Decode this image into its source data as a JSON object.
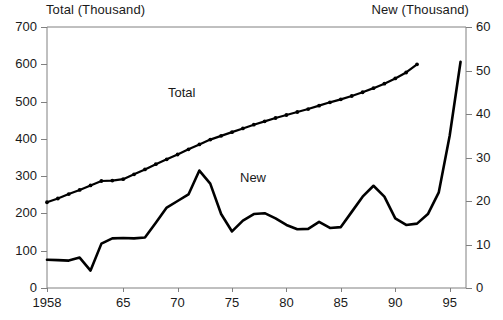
{
  "chart_data": {
    "type": "line",
    "title": "",
    "xlabel": "",
    "left_axis_title": "Total (Thousand)",
    "right_axis_title": "New (Thousand)",
    "grid": false,
    "legend_position": "inline-annotations",
    "x": [
      1958,
      1959,
      1960,
      1961,
      1962,
      1963,
      1964,
      1965,
      1966,
      1967,
      1968,
      1969,
      1970,
      1971,
      1972,
      1973,
      1974,
      1975,
      1976,
      1977,
      1978,
      1979,
      1980,
      1981,
      1982,
      1983,
      1984,
      1985,
      1986,
      1987,
      1988,
      1989,
      1990,
      1991,
      1992,
      1993,
      1994,
      1995,
      1996
    ],
    "xlim": [
      1958,
      1996.5
    ],
    "xticks": [
      1958,
      1965,
      1970,
      1975,
      1980,
      1985,
      1990,
      1995
    ],
    "xticklabels": [
      "1958",
      "65",
      "70",
      "75",
      "80",
      "85",
      "90",
      "95"
    ],
    "ylim_left": [
      0,
      700
    ],
    "yticks_left": [
      0,
      100,
      200,
      300,
      400,
      500,
      600,
      700
    ],
    "yticklabels_left": [
      "0",
      "100",
      "200",
      "300",
      "400",
      "500",
      "600",
      "700"
    ],
    "ylim_right": [
      0,
      60
    ],
    "yticks_right": [
      0,
      10,
      20,
      30,
      40,
      50,
      60
    ],
    "yticklabels_right": [
      "0",
      "10",
      "20",
      "30",
      "40",
      "50",
      "60"
    ],
    "series": [
      {
        "name": "Total",
        "axis": "left",
        "marker": "dot",
        "annotation": "Total",
        "x": [
          1958,
          1959,
          1960,
          1961,
          1962,
          1963,
          1964,
          1965,
          1966,
          1967,
          1968,
          1969,
          1970,
          1971,
          1972,
          1973,
          1974,
          1975,
          1976,
          1977,
          1978,
          1979,
          1980,
          1981,
          1982,
          1983,
          1984,
          1985,
          1986,
          1987,
          1988,
          1989,
          1990,
          1991,
          1992
        ],
        "values": [
          230,
          240,
          252,
          263,
          275,
          287,
          288,
          292,
          305,
          318,
          332,
          345,
          358,
          372,
          385,
          398,
          408,
          418,
          428,
          438,
          447,
          456,
          464,
          472,
          480,
          489,
          498,
          506,
          515,
          525,
          536,
          548,
          562,
          578,
          600
        ]
      },
      {
        "name": "New",
        "axis": "right",
        "marker": "none",
        "annotation": "New",
        "x": [
          1958,
          1959,
          1960,
          1961,
          1962,
          1963,
          1964,
          1965,
          1966,
          1967,
          1968,
          1969,
          1970,
          1971,
          1972,
          1973,
          1974,
          1975,
          1976,
          1977,
          1978,
          1979,
          1980,
          1981,
          1982,
          1983,
          1984,
          1985,
          1986,
          1987,
          1988,
          1989,
          1990,
          1991,
          1992,
          1993,
          1994,
          1995,
          1996
        ],
        "values": [
          6.5,
          6.4,
          6.3,
          7.0,
          4.0,
          10.2,
          11.4,
          11.5,
          11.4,
          11.6,
          15.0,
          18.5,
          20.0,
          21.5,
          27.0,
          24.0,
          17.0,
          13.0,
          15.5,
          17.0,
          17.2,
          16.0,
          14.5,
          13.5,
          13.6,
          15.2,
          13.8,
          14.0,
          17.5,
          21.0,
          23.5,
          21.0,
          16.0,
          14.5,
          14.8,
          17.0,
          22.0,
          35.0,
          52.0
        ]
      }
    ]
  },
  "annotations": {
    "total_label": "Total",
    "new_label": "New"
  }
}
